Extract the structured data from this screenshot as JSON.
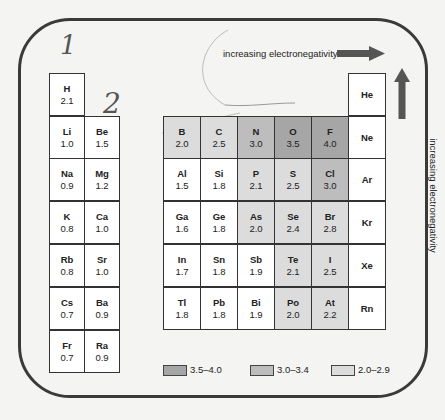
{
  "handwritten": {
    "one": "1",
    "two": "2"
  },
  "arrows": {
    "horizontal_label": "increasing electronegativity",
    "vertical_label": "increasing electronegativity",
    "color": "#555555"
  },
  "colors": {
    "range_3_5_4_0": "#a6a6a6",
    "range_3_0_3_4": "#bdbdbd",
    "range_2_0_2_9": "#dcdcdc"
  },
  "elements": {
    "H": {
      "symbol": "H",
      "value": "2.1"
    },
    "Li": {
      "symbol": "Li",
      "value": "1.0"
    },
    "Be": {
      "symbol": "Be",
      "value": "1.5"
    },
    "Na": {
      "symbol": "Na",
      "value": "0.9"
    },
    "Mg": {
      "symbol": "Mg",
      "value": "1.2"
    },
    "K": {
      "symbol": "K",
      "value": "0.8"
    },
    "Ca": {
      "symbol": "Ca",
      "value": "1.0"
    },
    "Rb": {
      "symbol": "Rb",
      "value": "0.8"
    },
    "Sr": {
      "symbol": "Sr",
      "value": "1.0"
    },
    "Cs": {
      "symbol": "Cs",
      "value": "0.7"
    },
    "Ba": {
      "symbol": "Ba",
      "value": "0.9"
    },
    "Fr": {
      "symbol": "Fr",
      "value": "0.7"
    },
    "Ra": {
      "symbol": "Ra",
      "value": "0.9"
    },
    "B": {
      "symbol": "B",
      "value": "2.0"
    },
    "C": {
      "symbol": "C",
      "value": "2.5"
    },
    "N": {
      "symbol": "N",
      "value": "3.0"
    },
    "O": {
      "symbol": "O",
      "value": "3.5"
    },
    "F": {
      "symbol": "F",
      "value": "4.0"
    },
    "Al": {
      "symbol": "Al",
      "value": "1.5"
    },
    "Si": {
      "symbol": "Si",
      "value": "1.8"
    },
    "P": {
      "symbol": "P",
      "value": "2.1"
    },
    "S": {
      "symbol": "S",
      "value": "2.5"
    },
    "Cl": {
      "symbol": "Cl",
      "value": "3.0"
    },
    "Ga": {
      "symbol": "Ga",
      "value": "1.6"
    },
    "Ge": {
      "symbol": "Ge",
      "value": "1.8"
    },
    "As": {
      "symbol": "As",
      "value": "2.0"
    },
    "Se": {
      "symbol": "Se",
      "value": "2.4"
    },
    "Br": {
      "symbol": "Br",
      "value": "2.8"
    },
    "In": {
      "symbol": "In",
      "value": "1.7"
    },
    "Sn": {
      "symbol": "Sn",
      "value": "1.8"
    },
    "Sb": {
      "symbol": "Sb",
      "value": "1.9"
    },
    "Te": {
      "symbol": "Te",
      "value": "2.1"
    },
    "I": {
      "symbol": "I",
      "value": "2.5"
    },
    "Tl": {
      "symbol": "Tl",
      "value": "1.8"
    },
    "Pb": {
      "symbol": "Pb",
      "value": "1.8"
    },
    "Bi": {
      "symbol": "Bi",
      "value": "1.9"
    },
    "Po": {
      "symbol": "Po",
      "value": "2.0"
    },
    "At": {
      "symbol": "At",
      "value": "2.2"
    },
    "He": {
      "symbol": "He"
    },
    "Ne": {
      "symbol": "Ne"
    },
    "Ar": {
      "symbol": "Ar"
    },
    "Kr": {
      "symbol": "Kr"
    },
    "Xe": {
      "symbol": "Xe"
    },
    "Rn": {
      "symbol": "Rn"
    }
  },
  "legend": [
    {
      "label": "3.5–4.0"
    },
    {
      "label": "3.0–3.4"
    },
    {
      "label": "2.0–2.9"
    }
  ]
}
